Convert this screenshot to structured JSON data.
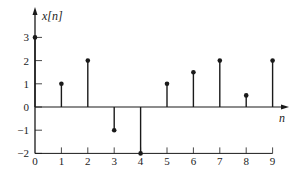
{
  "chart_data": {
    "type": "stem",
    "title": "",
    "xlabel": "n",
    "ylabel": "x[n]",
    "x": [
      0,
      1,
      2,
      3,
      4,
      5,
      6,
      7,
      8,
      9
    ],
    "values": [
      3,
      1,
      2,
      -1,
      -2,
      1,
      1.5,
      2,
      0.5,
      2
    ],
    "xticks": [
      "0",
      "1",
      "2",
      "3",
      "4",
      "5",
      "6",
      "7",
      "8",
      "9"
    ],
    "yticks": [
      "3",
      "2",
      "1",
      "0",
      "−1",
      "−2"
    ],
    "ytick_values": [
      3,
      2,
      1,
      0,
      -1,
      -2
    ],
    "ylim": [
      -2,
      3.5
    ],
    "xlim": [
      0,
      9.5
    ],
    "grid": false,
    "legend": null,
    "colors": {
      "stem": "#1a1a1a",
      "axis": "#1a1a1a"
    }
  }
}
